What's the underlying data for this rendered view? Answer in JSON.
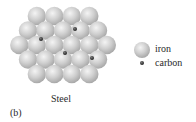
{
  "figure": {
    "panel_label": "(b)",
    "caption": "Steel"
  },
  "legend": {
    "items": [
      {
        "label": "iron",
        "symbol": "iron-sphere-icon"
      },
      {
        "label": "carbon",
        "symbol": "carbon-dot-icon"
      }
    ]
  },
  "lattice": {
    "rows": [
      4,
      5,
      6,
      5,
      4
    ],
    "iron_color": "#c8c8c8",
    "carbon_color": "#3a3a3a",
    "carbon_positions": [
      [
        41,
        39
      ],
      [
        75,
        29
      ],
      [
        65,
        53
      ],
      [
        92,
        58
      ]
    ]
  }
}
